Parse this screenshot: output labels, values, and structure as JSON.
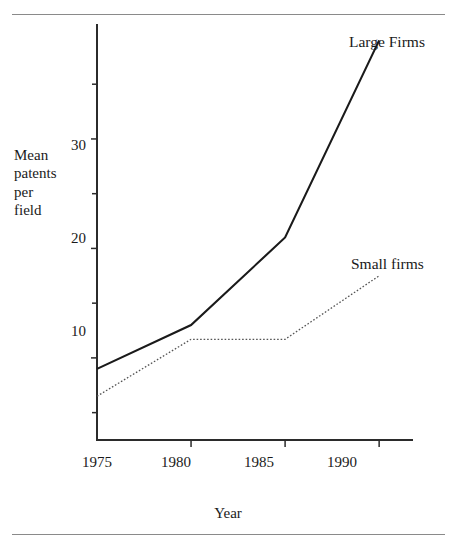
{
  "figure": {
    "background_color": "#ffffff",
    "ink_color": "#1a1a1a",
    "rule_color": "#8a8a8a",
    "top_rule_name": "top-divider",
    "bottom_rule_name": "bottom-divider"
  },
  "chart_data": {
    "type": "line",
    "title": "",
    "subtitle": "",
    "xlabel": "Year",
    "ylabel": "Mean patents per field",
    "ylabel_lines": [
      "Mean",
      "patents",
      "per",
      "field"
    ],
    "x": [
      1975,
      1980,
      1985,
      1990
    ],
    "categories": [
      "1975",
      "1980",
      "1985",
      "1990"
    ],
    "xtick_labels": [
      "1975",
      "1980",
      "1985",
      "1990"
    ],
    "ytick_labels": [
      "10",
      "20",
      "30"
    ],
    "ytick_values": [
      10,
      20,
      30
    ],
    "yminor_tick_values": [
      5,
      15,
      25,
      35
    ],
    "xlim": [
      1975,
      1991.8
    ],
    "ylim": [
      2.5,
      40.5
    ],
    "grid": false,
    "legend_position": "inline-right-of-line-ends",
    "series": [
      {
        "name": "Large Firms",
        "label": "Large Firms",
        "style": "solid",
        "color": "#1a1a1a",
        "linewidth": 2.1,
        "values": [
          9,
          13,
          21,
          39
        ]
      },
      {
        "name": "Small firms",
        "label": "Small firms",
        "style": "dotted",
        "color": "#555555",
        "linewidth": 1.3,
        "values": [
          6.5,
          11.7,
          11.7,
          17.5
        ]
      }
    ],
    "annotations": []
  }
}
